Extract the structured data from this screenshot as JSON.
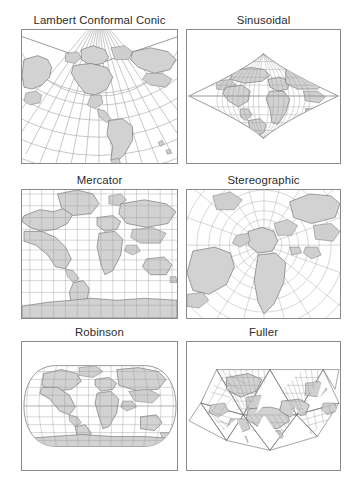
{
  "figure": {
    "title": "",
    "background_color": "#ffffff",
    "land_color": "#d2d2d2",
    "graticule_color": "#8e8e8e",
    "border_color": "#8a8a8a",
    "title_color": "#2b2b2b",
    "columns": 2,
    "rows": 3
  },
  "panels": [
    {
      "id": "lambert-conformal-conic",
      "label": "Lambert Conformal Conic",
      "type": "conic",
      "row": 1,
      "column": 1,
      "x": 21,
      "y": 12,
      "width": 157,
      "height": 152,
      "description": "Conic projection with meridians converging to an apex above the top-centre of the frame and concentric arc parallels; Americas centred."
    },
    {
      "id": "sinusoidal",
      "label": "Sinusoidal",
      "type": "pseudocylindrical",
      "row": 1,
      "column": 2,
      "x": 186,
      "y": 12,
      "width": 155,
      "height": 152,
      "description": "Pointed-pole lens outline with straight horizontal parallels and sinusoidal meridians; equal-area world map."
    },
    {
      "id": "mercator",
      "label": "Mercator",
      "type": "cylindrical",
      "row": 2,
      "column": 1,
      "x": 21,
      "y": 172,
      "width": 157,
      "height": 147,
      "description": "Rectangular cylindrical projection, straight orthogonal graticule, polar areas greatly exaggerated."
    },
    {
      "id": "stereographic",
      "label": "Stereographic",
      "type": "azimuthal",
      "row": 2,
      "column": 2,
      "x": 186,
      "y": 172,
      "width": 155,
      "height": 147,
      "description": "Azimuthal projection with radial meridians and concentric circular parallels centred over Europe."
    },
    {
      "id": "robinson",
      "label": "Robinson",
      "type": "pseudocylindrical",
      "row": 3,
      "column": 1,
      "x": 21,
      "y": 324,
      "width": 157,
      "height": 147,
      "description": "Rounded-rectangle world outline with flattened poles, straight parallels and curved meridians."
    },
    {
      "id": "fuller",
      "label": "Fuller",
      "type": "polyhedral",
      "row": 3,
      "column": 2,
      "x": 186,
      "y": 324,
      "width": 155,
      "height": 147,
      "description": "Dymaxion icosahedral projection: the globe unfolded onto triangular facets each carrying its own grid."
    }
  ]
}
